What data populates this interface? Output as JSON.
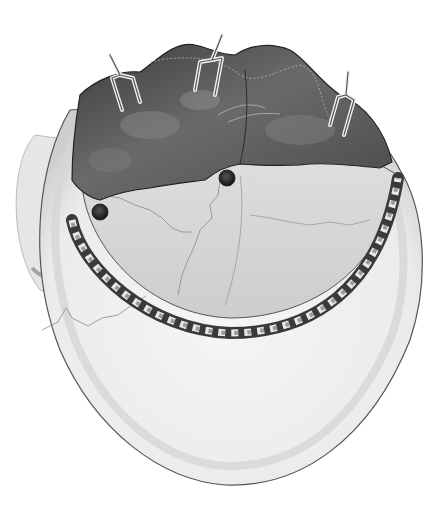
{
  "image": {
    "description": "Grayscale medical illustration of a craniotomy: skull viewed from above with a bone flap outlined by saw-cut perforations, burr holes, and the dura/brain surface retracted by three hook retractors",
    "palette": {
      "background": "#ffffff",
      "skull_light": "#eeeeee",
      "skull_rim": "#cfcfcf",
      "bone_flap": "#dcdcdc",
      "brain_dark": "#4a4a4a",
      "brain_mid": "#6e6e6e",
      "outline": "#333333"
    },
    "elements": {
      "retractors": 3,
      "burr_holes": 2
    }
  }
}
